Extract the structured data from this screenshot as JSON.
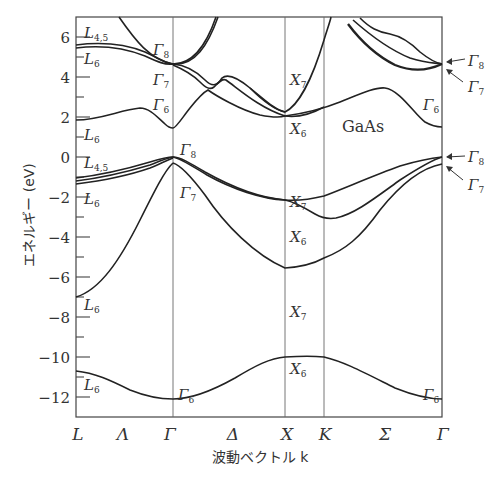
{
  "diagram": {
    "title": "GaAs",
    "type": "electronic band structure",
    "y_axis": {
      "label": "エネルギー (eV)",
      "ticks": [
        "6",
        "4",
        "2",
        "0",
        "−2",
        "−4",
        "−6",
        "−8",
        "−10",
        "−12"
      ],
      "range": [
        -13,
        7
      ]
    },
    "x_axis": {
      "label": "波動ベクトル k",
      "points": [
        "L",
        "Λ",
        "Γ",
        "Δ",
        "X",
        "K",
        "Σ",
        "Γ"
      ]
    },
    "labels": {
      "L45_top": {
        "main": "L",
        "sub": "4,5"
      },
      "L6_top": {
        "main": "L",
        "sub": "6"
      },
      "L6_cb": {
        "main": "L",
        "sub": "6"
      },
      "L45_vb": {
        "main": "L",
        "sub": "4,5"
      },
      "L6_vb": {
        "main": "L",
        "sub": "6"
      },
      "L6_low": {
        "main": "L",
        "sub": "6"
      },
      "L6_bottom": {
        "main": "L",
        "sub": "6"
      },
      "G8_top": {
        "main": "Γ",
        "sub": "8"
      },
      "G7_top": {
        "main": "Γ",
        "sub": "7"
      },
      "G6_cb": {
        "main": "Γ",
        "sub": "6"
      },
      "G8_vb": {
        "main": "Γ",
        "sub": "8"
      },
      "G7_vb": {
        "main": "Γ",
        "sub": "7"
      },
      "G6_bottom": {
        "main": "Γ",
        "sub": "6"
      },
      "X7_cb": {
        "main": "X",
        "sub": "7"
      },
      "X6_cb": {
        "main": "X",
        "sub": "6"
      },
      "X7_vb": {
        "main": "X",
        "sub": "7"
      },
      "X6_vb": {
        "main": "X",
        "sub": "6"
      },
      "X7_low": {
        "main": "X",
        "sub": "7"
      },
      "X6_bottom": {
        "main": "X",
        "sub": "6"
      },
      "G8_right_top": {
        "main": "Γ",
        "sub": "8"
      },
      "G7_right_top": {
        "main": "Γ",
        "sub": "7"
      },
      "G6_right_cb": {
        "main": "Γ",
        "sub": "6"
      },
      "G8_right_vb": {
        "main": "Γ",
        "sub": "8"
      },
      "G7_right_vb": {
        "main": "Γ",
        "sub": "7"
      },
      "G6_right_bottom": {
        "main": "Γ",
        "sub": "6"
      }
    },
    "key_energies_eV": {
      "Gamma6_conduction": 1.5,
      "Gamma8_valence": 0.0,
      "Gamma7_valence": -0.34,
      "Gamma6_bottom": -12.5,
      "L6_conduction": 1.8,
      "X6_conduction": 2.0,
      "X7_conduction": 2.3,
      "X7_valence": -2.9,
      "X6_valence": -3.0,
      "X7_lower": -7.0,
      "X6_bottom": -10.0,
      "L6_lower": -7.0,
      "L6_bottom": -10.7,
      "Gamma8_upper": 4.6
    },
    "colors": {
      "line": "#222222",
      "text": "#333333",
      "background": "#ffffff"
    }
  }
}
